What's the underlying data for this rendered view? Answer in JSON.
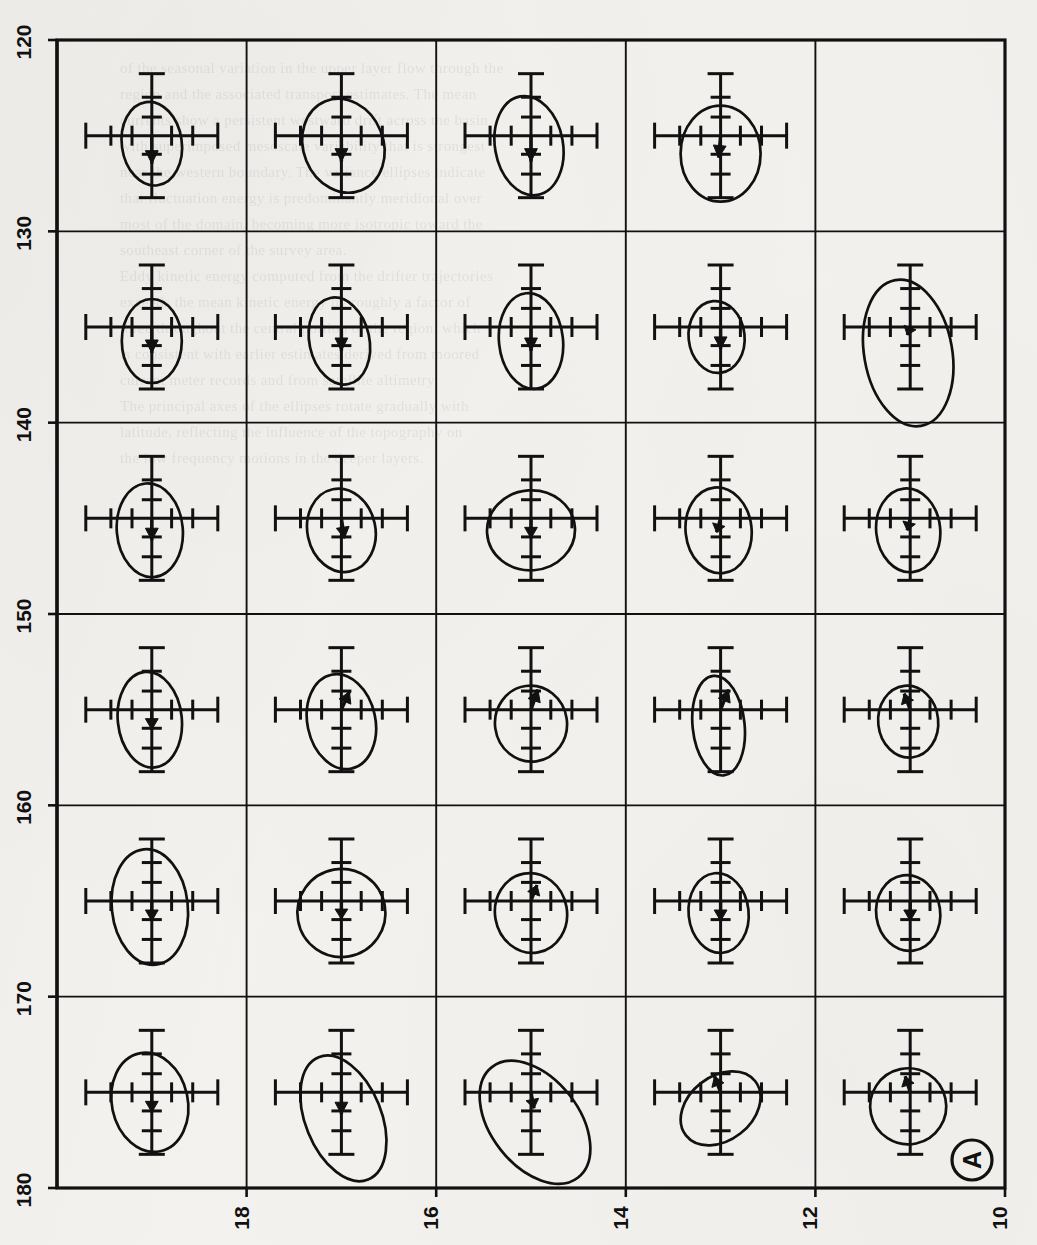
{
  "figure": {
    "panel_label": "A",
    "left_axis": {
      "name": "latitude-axis",
      "ticks": [
        "120",
        "130",
        "140",
        "150",
        "160",
        "170",
        "180"
      ],
      "min": 120,
      "max": 180,
      "orientation": "vertical-rotated-labels"
    },
    "bottom_axis": {
      "name": "longitude-axis",
      "ticks": [
        "18",
        "16",
        "14",
        "12",
        "10"
      ],
      "min": 10,
      "max": 18,
      "direction": "decreasing-left-to-right",
      "orientation": "horizontal-rotated-labels"
    },
    "grid": {
      "rows": 6,
      "cols": 5,
      "line_color": "#111111"
    },
    "ink_color": "#111111",
    "background_color": "#f3f2ef"
  },
  "chart_data": {
    "type": "scatter",
    "title": "",
    "subtitle": "",
    "xlabel": "",
    "ylabel": "",
    "xlim": [
      18,
      10
    ],
    "ylim": [
      180,
      120
    ],
    "grid": true,
    "legend": "none",
    "x": [
      "18",
      "16",
      "14",
      "12",
      "10"
    ],
    "y": [
      "120",
      "130",
      "140",
      "150",
      "160",
      "170",
      "180"
    ],
    "cells": [
      {
        "row": 1,
        "col": 1,
        "empty": false,
        "ellipse": {
          "rx": 30,
          "ry": 42,
          "angle": -8,
          "cx": 0,
          "cy": 8
        },
        "arrow": {
          "dx": 0,
          "dy": 28,
          "angle": 90
        },
        "note": "narrow vertical ellipse, short down arrow"
      },
      {
        "row": 1,
        "col": 2,
        "empty": false,
        "ellipse": {
          "rx": 40,
          "ry": 48,
          "angle": -22,
          "cx": 2,
          "cy": 10
        },
        "arrow": {
          "dx": 0,
          "dy": 26,
          "angle": 90
        },
        "note": "tilted ellipse, down arrow"
      },
      {
        "row": 1,
        "col": 3,
        "empty": false,
        "ellipse": {
          "rx": 34,
          "ry": 50,
          "angle": -10,
          "cx": -2,
          "cy": 10
        },
        "arrow": {
          "dx": 0,
          "dy": 26,
          "angle": 90
        },
        "note": "tall ellipse, down arrow"
      },
      {
        "row": 1,
        "col": 4,
        "empty": false,
        "ellipse": {
          "rx": 40,
          "ry": 48,
          "angle": 0,
          "cx": 0,
          "cy": 18
        },
        "arrow": {
          "dx": -2,
          "dy": 22,
          "angle": 95
        },
        "note": "round ellipse offset low"
      },
      {
        "row": 1,
        "col": 5,
        "empty": true,
        "ellipse": null,
        "arrow": null,
        "note": "empty cell — no data"
      },
      {
        "row": 2,
        "col": 1,
        "empty": false,
        "ellipse": {
          "rx": 30,
          "ry": 42,
          "angle": 0,
          "cx": 0,
          "cy": 14
        },
        "arrow": {
          "dx": 0,
          "dy": 26,
          "angle": 90
        },
        "note": "vertical ellipse, down arrow"
      },
      {
        "row": 2,
        "col": 2,
        "empty": false,
        "ellipse": {
          "rx": 30,
          "ry": 44,
          "angle": -12,
          "cx": -2,
          "cy": 14
        },
        "arrow": {
          "dx": 0,
          "dy": 24,
          "angle": 90
        },
        "note": "slightly tilted ellipse"
      },
      {
        "row": 2,
        "col": 3,
        "empty": false,
        "ellipse": {
          "rx": 32,
          "ry": 48,
          "angle": -6,
          "cx": 0,
          "cy": 14
        },
        "arrow": {
          "dx": 0,
          "dy": 24,
          "angle": 90
        },
        "note": "tall ellipse"
      },
      {
        "row": 2,
        "col": 4,
        "empty": false,
        "ellipse": {
          "rx": 28,
          "ry": 36,
          "angle": -6,
          "cx": -4,
          "cy": 10
        },
        "arrow": {
          "dx": 0,
          "dy": 22,
          "angle": 90
        },
        "note": "small ellipse"
      },
      {
        "row": 2,
        "col": 5,
        "empty": false,
        "ellipse": {
          "rx": 44,
          "ry": 74,
          "angle": -10,
          "cx": -2,
          "cy": 26
        },
        "arrow": {
          "dx": -3,
          "dy": 8,
          "angle": 110
        },
        "note": "very large tall ellipse overflowing cell"
      },
      {
        "row": 3,
        "col": 1,
        "empty": false,
        "ellipse": {
          "rx": 33,
          "ry": 47,
          "angle": -5,
          "cx": -2,
          "cy": 12
        },
        "arrow": {
          "dx": 0,
          "dy": 22,
          "angle": 90
        },
        "note": "tall ellipse"
      },
      {
        "row": 3,
        "col": 2,
        "empty": false,
        "ellipse": {
          "rx": 34,
          "ry": 42,
          "angle": -12,
          "cx": 0,
          "cy": 12
        },
        "arrow": {
          "dx": 3,
          "dy": 20,
          "angle": 80
        },
        "note": "tilted ellipse"
      },
      {
        "row": 3,
        "col": 3,
        "empty": false,
        "ellipse": {
          "rx": 44,
          "ry": 40,
          "angle": -4,
          "cx": 0,
          "cy": 12
        },
        "arrow": {
          "dx": 0,
          "dy": 20,
          "angle": 90
        },
        "note": "wide round ellipse"
      },
      {
        "row": 3,
        "col": 4,
        "empty": false,
        "ellipse": {
          "rx": 33,
          "ry": 43,
          "angle": -6,
          "cx": -2,
          "cy": 12
        },
        "arrow": {
          "dx": -4,
          "dy": 14,
          "angle": 105
        },
        "note": "tall ellipse"
      },
      {
        "row": 3,
        "col": 5,
        "empty": false,
        "ellipse": {
          "rx": 32,
          "ry": 42,
          "angle": -6,
          "cx": -2,
          "cy": 12
        },
        "arrow": {
          "dx": -3,
          "dy": 12,
          "angle": 104
        },
        "note": "tall ellipse"
      },
      {
        "row": 4,
        "col": 1,
        "empty": false,
        "ellipse": {
          "rx": 32,
          "ry": 48,
          "angle": -6,
          "cx": -2,
          "cy": 10
        },
        "arrow": {
          "dx": 0,
          "dy": 20,
          "angle": 90
        },
        "note": "tall ellipse"
      },
      {
        "row": 4,
        "col": 2,
        "empty": false,
        "ellipse": {
          "rx": 34,
          "ry": 48,
          "angle": -12,
          "cx": 0,
          "cy": 12
        },
        "arrow": {
          "dx": 8,
          "dy": -18,
          "angle": -66
        },
        "note": "arrow up-right"
      },
      {
        "row": 4,
        "col": 3,
        "empty": false,
        "ellipse": {
          "rx": 36,
          "ry": 38,
          "angle": -8,
          "cx": 0,
          "cy": 14
        },
        "arrow": {
          "dx": 7,
          "dy": -20,
          "angle": -70
        },
        "note": "round ellipse, arrow up-right"
      },
      {
        "row": 4,
        "col": 4,
        "empty": false,
        "ellipse": {
          "rx": 26,
          "ry": 50,
          "angle": -6,
          "cx": -2,
          "cy": 16
        },
        "arrow": {
          "dx": 8,
          "dy": -20,
          "angle": -68
        },
        "note": "narrow tall ellipse, arrow up-right"
      },
      {
        "row": 4,
        "col": 5,
        "empty": false,
        "ellipse": {
          "rx": 30,
          "ry": 36,
          "angle": -6,
          "cx": -2,
          "cy": 12
        },
        "arrow": {
          "dx": -6,
          "dy": -16,
          "angle": -110
        },
        "note": "arrow up-left"
      },
      {
        "row": 5,
        "col": 1,
        "empty": false,
        "ellipse": {
          "rx": 38,
          "ry": 58,
          "angle": -6,
          "cx": -2,
          "cy": 6
        },
        "arrow": {
          "dx": 0,
          "dy": 20,
          "angle": 90
        },
        "note": "large tall ellipse"
      },
      {
        "row": 5,
        "col": 2,
        "empty": false,
        "ellipse": {
          "rx": 44,
          "ry": 44,
          "angle": -10,
          "cx": 0,
          "cy": 12
        },
        "arrow": {
          "dx": 0,
          "dy": 18,
          "angle": 90
        },
        "note": "round ellipse"
      },
      {
        "row": 5,
        "col": 3,
        "empty": false,
        "ellipse": {
          "rx": 36,
          "ry": 40,
          "angle": -10,
          "cx": 0,
          "cy": 12
        },
        "arrow": {
          "dx": 6,
          "dy": -16,
          "angle": -70
        },
        "note": "arrow up-right"
      },
      {
        "row": 5,
        "col": 4,
        "empty": false,
        "ellipse": {
          "rx": 30,
          "ry": 40,
          "angle": -6,
          "cx": -2,
          "cy": 12
        },
        "arrow": {
          "dx": 0,
          "dy": 20,
          "angle": 90
        },
        "note": "tall ellipse"
      },
      {
        "row": 5,
        "col": 5,
        "empty": false,
        "ellipse": {
          "rx": 32,
          "ry": 38,
          "angle": -8,
          "cx": -2,
          "cy": 12
        },
        "arrow": {
          "dx": 0,
          "dy": 20,
          "angle": 90
        },
        "note": "round ellipse"
      },
      {
        "row": 6,
        "col": 1,
        "empty": false,
        "ellipse": {
          "rx": 38,
          "ry": 50,
          "angle": -12,
          "cx": -2,
          "cy": 10
        },
        "arrow": {
          "dx": 0,
          "dy": 20,
          "angle": 90
        },
        "note": "large ellipse"
      },
      {
        "row": 6,
        "col": 2,
        "empty": false,
        "ellipse": {
          "rx": 38,
          "ry": 66,
          "angle": -22,
          "cx": 2,
          "cy": 26
        },
        "arrow": {
          "dx": 0,
          "dy": 22,
          "angle": 90
        },
        "note": "large tilted ellipse overflowing cell"
      },
      {
        "row": 6,
        "col": 3,
        "empty": false,
        "ellipse": {
          "rx": 44,
          "ry": 70,
          "angle": -38,
          "cx": 4,
          "cy": 30
        },
        "arrow": {
          "dx": 3,
          "dy": 16,
          "angle": 80
        },
        "note": "large strongly tilted ellipse overflowing cell"
      },
      {
        "row": 6,
        "col": 4,
        "empty": false,
        "ellipse": {
          "rx": 44,
          "ry": 32,
          "angle": -38,
          "cx": 0,
          "cy": 16
        },
        "arrow": {
          "dx": -6,
          "dy": -16,
          "angle": -110
        },
        "note": "tilted ellipse, arrow up-left"
      },
      {
        "row": 6,
        "col": 5,
        "empty": false,
        "ellipse": {
          "rx": 38,
          "ry": 38,
          "angle": -12,
          "cx": -2,
          "cy": 14
        },
        "arrow": {
          "dx": -5,
          "dy": -16,
          "angle": -108
        },
        "note": "round ellipse, arrow up-left"
      }
    ]
  },
  "ghost": {
    "lines": [
      "of the seasonal variation in the upper layer flow through the",
      "region and the associated transport estimates. The mean",
      "currents show a persistent westward drift across the basin",
      "with superimposed mesoscale variability that is strongest",
      "near the western boundary. The variance ellipses indicate",
      "that fluctuation energy is predominantly meridional over",
      "most of the domain, becoming more isotropic toward the",
      "southeast corner of the survey area.",
      "Eddy kinetic energy computed from the drifter trajectories",
      "exceeds the mean kinetic energy by roughly a factor of",
      "three throughout the central portion of the region, which",
      "is consistent with earlier estimates derived from moored",
      "current meter records and from satellite altimetry.",
      "The principal axes of the ellipses rotate gradually with",
      "latitude, reflecting the influence of the topography on",
      "the low frequency motions in the deeper layers."
    ]
  }
}
